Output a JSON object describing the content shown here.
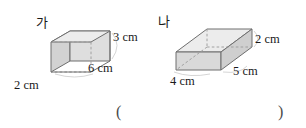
{
  "page": {
    "type": "math-worksheet-figure",
    "width": 306,
    "height": 128,
    "background": "#ffffff"
  },
  "colors": {
    "edge": "#6e6e6e",
    "hidden_edge": "#9a9a9a",
    "face_front": "#d0d0d0",
    "face_top": "#e9e9e9",
    "face_side": "#dcdcdc",
    "text": "#1a1a1a",
    "paren": "#4a4a4a"
  },
  "figures": [
    {
      "id": "ga",
      "label": "가",
      "shape": "rectangular-prism",
      "dimensions": [
        {
          "name": "height",
          "value": 3,
          "unit": "cm",
          "text": "3 cm"
        },
        {
          "name": "length",
          "value": 6,
          "unit": "cm",
          "text": "6 cm"
        },
        {
          "name": "width",
          "value": 2,
          "unit": "cm",
          "text": "2 cm"
        }
      ]
    },
    {
      "id": "na",
      "label": "나",
      "shape": "rectangular-prism",
      "dimensions": [
        {
          "name": "height",
          "value": 2,
          "unit": "cm",
          "text": "2 cm"
        },
        {
          "name": "length",
          "value": 5,
          "unit": "cm",
          "text": "5 cm"
        },
        {
          "name": "width",
          "value": 4,
          "unit": "cm",
          "text": "4 cm"
        }
      ]
    }
  ],
  "answer_field": {
    "open_paren": "(",
    "close_paren": ")",
    "value": ""
  }
}
